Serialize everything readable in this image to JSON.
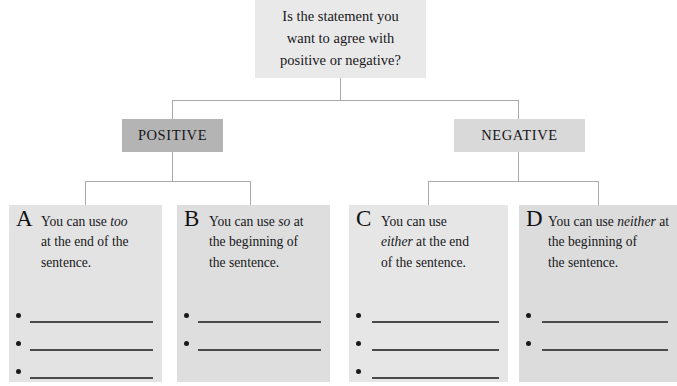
{
  "question": {
    "lines": [
      "Is the statement you",
      "want to agree with",
      "positive or negative?"
    ]
  },
  "branches": [
    {
      "id": "positive",
      "label": "POSITIVE",
      "color": "#b4b4b4"
    },
    {
      "id": "negative",
      "label": "NEGATIVE",
      "color": "#d9d9d9"
    }
  ],
  "cards": [
    {
      "letter": "A",
      "lines": [
        {
          "pre": "You can use ",
          "kw": "too",
          "post": ""
        },
        {
          "pre": "at the end of the",
          "kw": "",
          "post": ""
        },
        {
          "pre": "sentence.",
          "kw": "",
          "post": ""
        }
      ],
      "blank_count": 3,
      "color": "#e3e3e3"
    },
    {
      "letter": "B",
      "lines": [
        {
          "pre": "You can use ",
          "kw": "so",
          "post": " at"
        },
        {
          "pre": "the beginning of",
          "kw": "",
          "post": ""
        },
        {
          "pre": "the sentence.",
          "kw": "",
          "post": ""
        }
      ],
      "blank_count": 2,
      "color": "#dedede"
    },
    {
      "letter": "C",
      "lines": [
        {
          "pre": "You can use",
          "kw": "",
          "post": ""
        },
        {
          "pre": "",
          "kw": "either",
          "post": " at the end"
        },
        {
          "pre": "of the sentence.",
          "kw": "",
          "post": ""
        }
      ],
      "blank_count": 3,
      "color": "#e6e6e6"
    },
    {
      "letter": "D",
      "lines": [
        {
          "pre": "You can use ",
          "kw": "neither",
          "post": " at"
        },
        {
          "pre": "the beginning of",
          "kw": "",
          "post": ""
        },
        {
          "pre": "the sentence.",
          "kw": "",
          "post": ""
        }
      ],
      "blank_count": 2,
      "color": "#dcdcdc"
    }
  ],
  "style": {
    "connector_color": "#a9a9a9",
    "text_color": "#17171a",
    "rule_color": "#4a4a4a",
    "bullet_color": "#1a1a1a",
    "question_bg": "#e9e9e9"
  }
}
